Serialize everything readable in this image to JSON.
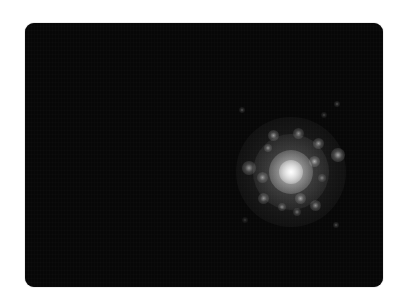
{
  "image": {
    "description": "Electron diffraction pattern with a bright central beam and surrounding diffraction spots",
    "background_color": "#ffffff",
    "frame_color": "#070707",
    "frame": {
      "left": 25,
      "top": 23,
      "width": 358,
      "height": 264,
      "radius": 9
    }
  },
  "pattern": {
    "center": {
      "x": 291,
      "y": 172
    },
    "halo": [
      {
        "r": 55,
        "color": "rgba(150,150,150,0.22)"
      },
      {
        "r": 38,
        "color": "rgba(190,190,190,0.30)"
      },
      {
        "r": 22,
        "color": "rgba(235,235,235,0.70)"
      },
      {
        "r": 12,
        "color": "rgba(255,255,255,1)"
      }
    ],
    "spots": [
      {
        "x": 273,
        "y": 135,
        "r": 2.5,
        "a": 0.55
      },
      {
        "x": 298,
        "y": 133,
        "r": 2.5,
        "a": 0.5
      },
      {
        "x": 318,
        "y": 143,
        "r": 2.5,
        "a": 0.55
      },
      {
        "x": 268,
        "y": 148,
        "r": 2,
        "a": 0.5
      },
      {
        "x": 314,
        "y": 161,
        "r": 2.5,
        "a": 0.6
      },
      {
        "x": 338,
        "y": 155,
        "r": 3,
        "a": 0.6
      },
      {
        "x": 249,
        "y": 168,
        "r": 3,
        "a": 0.55
      },
      {
        "x": 262,
        "y": 177,
        "r": 2.5,
        "a": 0.5
      },
      {
        "x": 263,
        "y": 198,
        "r": 2.5,
        "a": 0.5
      },
      {
        "x": 300,
        "y": 198,
        "r": 2.5,
        "a": 0.55
      },
      {
        "x": 315,
        "y": 205,
        "r": 2.5,
        "a": 0.5
      },
      {
        "x": 282,
        "y": 207,
        "r": 2,
        "a": 0.45
      },
      {
        "x": 297,
        "y": 212,
        "r": 2,
        "a": 0.4
      },
      {
        "x": 322,
        "y": 178,
        "r": 2,
        "a": 0.4
      },
      {
        "x": 242,
        "y": 110,
        "r": 1.5,
        "a": 0.3
      },
      {
        "x": 337,
        "y": 104,
        "r": 1.5,
        "a": 0.3
      },
      {
        "x": 324,
        "y": 115,
        "r": 1.5,
        "a": 0.25
      },
      {
        "x": 336,
        "y": 225,
        "r": 1.5,
        "a": 0.3
      },
      {
        "x": 245,
        "y": 220,
        "r": 1.5,
        "a": 0.2
      }
    ]
  }
}
